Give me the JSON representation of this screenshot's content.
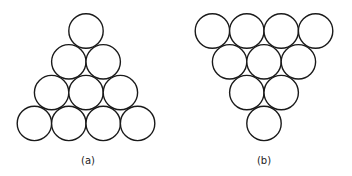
{
  "figures": [
    {
      "id": "a",
      "caption": "(a)",
      "arrangement": "triangle-apex-up",
      "rows": [
        1,
        2,
        3,
        4
      ],
      "total_circles": 10
    },
    {
      "id": "b",
      "caption": "(b)",
      "arrangement": "triangle-apex-down",
      "rows": [
        4,
        3,
        2,
        1
      ],
      "total_circles": 10
    }
  ],
  "colors": {
    "stroke": "#1a1a1a",
    "fill": "#ffffff",
    "background": "#ffffff"
  }
}
